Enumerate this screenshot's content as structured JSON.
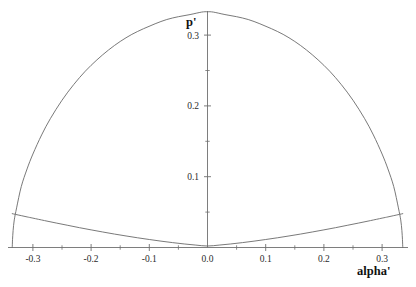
{
  "chart_data": {
    "type": "line",
    "title": "",
    "xlabel": "alpha'",
    "ylabel": "p'",
    "xlim": [
      -0.345,
      0.345
    ],
    "ylim": [
      0.0,
      0.345
    ],
    "grid": false,
    "legend": "none",
    "x_ticks": [
      -0.3,
      -0.2,
      -0.1,
      0.0,
      0.1,
      0.2,
      0.3
    ],
    "x_tick_labels": [
      "-0.3",
      "-0.2",
      "-0.1",
      "0.0",
      "0.1",
      "0.2",
      "0.3"
    ],
    "x_minor_ticks": [
      -0.25,
      -0.15,
      -0.05,
      0.05,
      0.15,
      0.25
    ],
    "y_ticks": [
      0.1,
      0.2,
      0.3
    ],
    "y_tick_labels": [
      "0.1",
      "0.2",
      "0.3"
    ],
    "y_minor_ticks": [
      0.05,
      0.15,
      0.25
    ],
    "axis_origin": [
      0.0,
      0.0
    ],
    "series": [
      {
        "name": "upper-dome-curve",
        "style": "solid",
        "color": "#6a6a6a",
        "x": [
          -0.3355,
          -0.335,
          -0.334,
          -0.332,
          -0.328,
          -0.32,
          -0.31,
          -0.3,
          -0.285,
          -0.27,
          -0.25,
          -0.23,
          -0.21,
          -0.19,
          -0.17,
          -0.15,
          -0.13,
          -0.11,
          -0.09,
          -0.07,
          -0.05,
          -0.03,
          -0.01,
          0.0,
          0.01,
          0.03,
          0.05,
          0.07,
          0.09,
          0.11,
          0.13,
          0.15,
          0.17,
          0.19,
          0.21,
          0.23,
          0.25,
          0.27,
          0.285,
          0.3,
          0.31,
          0.32,
          0.328,
          0.332,
          0.334,
          0.335,
          0.3355
        ],
        "y": [
          0.0,
          0.011,
          0.024,
          0.039,
          0.056,
          0.086,
          0.111,
          0.132,
          0.159,
          0.182,
          0.208,
          0.23,
          0.249,
          0.265,
          0.279,
          0.291,
          0.301,
          0.309,
          0.316,
          0.322,
          0.326,
          0.329,
          0.3325,
          0.333,
          0.3325,
          0.329,
          0.326,
          0.322,
          0.316,
          0.309,
          0.301,
          0.291,
          0.279,
          0.265,
          0.249,
          0.23,
          0.208,
          0.182,
          0.159,
          0.132,
          0.111,
          0.086,
          0.056,
          0.039,
          0.024,
          0.011,
          0.0
        ]
      },
      {
        "name": "lower-valley-curve",
        "style": "solid",
        "color": "#6a6a6a",
        "x": [
          -0.3355,
          -0.33,
          -0.32,
          -0.31,
          -0.3,
          -0.28,
          -0.26,
          -0.24,
          -0.22,
          -0.2,
          -0.18,
          -0.16,
          -0.14,
          -0.12,
          -0.1,
          -0.08,
          -0.06,
          -0.04,
          -0.02,
          0.0,
          0.02,
          0.04,
          0.06,
          0.08,
          0.1,
          0.12,
          0.14,
          0.16,
          0.18,
          0.2,
          0.22,
          0.24,
          0.26,
          0.28,
          0.3,
          0.31,
          0.32,
          0.33,
          0.3355
        ],
        "y": [
          0.0478,
          0.0468,
          0.045,
          0.0432,
          0.0415,
          0.038,
          0.0346,
          0.0313,
          0.028,
          0.0249,
          0.0219,
          0.019,
          0.0163,
          0.0137,
          0.0113,
          0.009,
          0.0069,
          0.005,
          0.0034,
          0.0021,
          0.0034,
          0.005,
          0.0069,
          0.009,
          0.0113,
          0.0137,
          0.0163,
          0.019,
          0.0219,
          0.0249,
          0.028,
          0.0313,
          0.0346,
          0.038,
          0.0415,
          0.0432,
          0.045,
          0.0468,
          0.0478
        ]
      }
    ],
    "annotations": []
  },
  "labels": {
    "y_axis_title": "p'",
    "x_axis_title": "alpha'"
  }
}
